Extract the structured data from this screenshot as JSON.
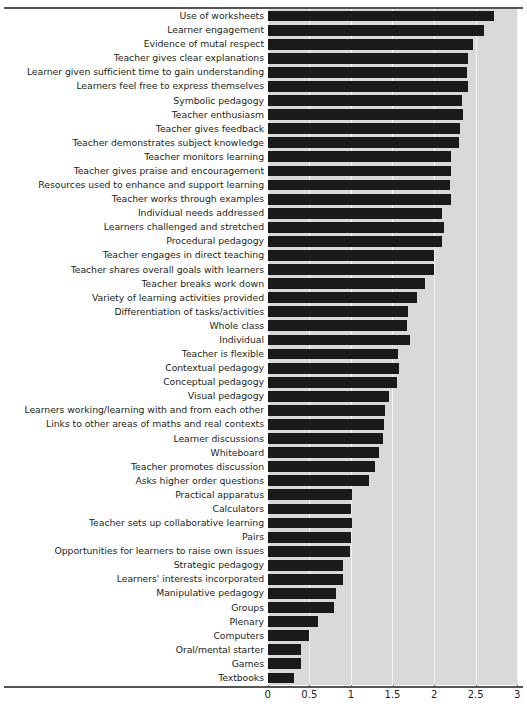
{
  "chart_data": {
    "type": "bar",
    "orientation": "horizontal",
    "title": "",
    "subtitle": "",
    "xlabel": "",
    "ylabel": "",
    "xlim": [
      0,
      3
    ],
    "xticks": [
      "0",
      "0.5",
      "1",
      "1.5",
      "2",
      "2.5",
      "3"
    ],
    "xtick_values": [
      0,
      0.5,
      1,
      1.5,
      2,
      2.5,
      3
    ],
    "grid": true,
    "legend": false,
    "bar_color": "#1a1a1a",
    "panel_color": "#d9d9d9",
    "gridline_color": "#f2f2f2",
    "categories": [
      "Use of worksheets",
      "Learner engagement",
      "Evidence of mutal respect",
      "Teacher gives clear explanations",
      "Learner given sufficient time to gain understanding",
      "Learners feel free to express themselves",
      "Symbolic pedagogy",
      "Teacher enthusiasm",
      "Teacher gives feedback",
      "Teacher demonstrates subject knowledge",
      "Teacher monitors learning",
      "Teacher gives praise and encouragement",
      "Resources used to enhance and support learning",
      "Teacher works through examples",
      "Individual needs addressed",
      "Learners challenged and stretched",
      "Procedural pedagogy",
      "Teacher engages in direct teaching",
      "Teacher shares overall goals with learners",
      "Teacher breaks work down",
      "Variety of learning activities provided",
      "Differentiation of tasks/activities",
      "Whole class",
      "Individual",
      "Teacher is flexible",
      "Contextual pedagogy",
      "Conceptual pedagogy",
      "Visual pedagogy",
      "Learners working/learning with and from each other",
      "Links to other areas of maths and real contexts",
      "Learner discussions",
      "Whiteboard",
      "Teacher promotes discussion",
      "Asks higher order questions",
      "Practical apparatus",
      "Calculators",
      "Teacher sets up collaborative learning",
      "Pairs",
      "Opportunities for learners to raise own issues",
      "Strategic pedagogy",
      "Learners' interests incorporated",
      "Manipulative pedagogy",
      "Groups",
      "Plenary",
      "Computers",
      "Oral/mental starter",
      "Games",
      "Textbooks"
    ],
    "values": [
      2.72,
      2.6,
      2.47,
      2.41,
      2.4,
      2.41,
      2.33,
      2.35,
      2.31,
      2.3,
      2.2,
      2.2,
      2.19,
      2.2,
      2.09,
      2.12,
      2.1,
      2.0,
      2.0,
      1.89,
      1.79,
      1.69,
      1.68,
      1.71,
      1.57,
      1.58,
      1.56,
      1.46,
      1.41,
      1.4,
      1.39,
      1.34,
      1.29,
      1.22,
      1.01,
      1.0,
      1.01,
      1.0,
      0.99,
      0.9,
      0.91,
      0.82,
      0.8,
      0.61,
      0.5,
      0.4,
      0.4,
      0.32
    ]
  }
}
